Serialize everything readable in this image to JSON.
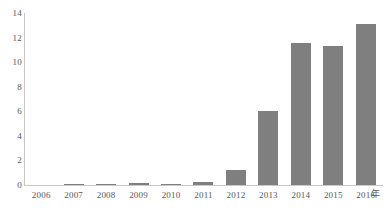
{
  "chart_data": {
    "type": "bar",
    "title": "",
    "subtitle": "",
    "xlabel": "年",
    "ylabel": "",
    "categories": [
      "2006",
      "2007",
      "2008",
      "2009",
      "2010",
      "2011",
      "2012",
      "2013",
      "2014",
      "2015",
      "2016"
    ],
    "values": [
      0,
      0.05,
      0.08,
      0.15,
      0.1,
      0.25,
      1.2,
      6.0,
      11.6,
      11.3,
      13.1
    ],
    "series": [
      {
        "name": "",
        "values": [
          0,
          0.05,
          0.08,
          0.15,
          0.1,
          0.25,
          1.2,
          6.0,
          11.6,
          11.3,
          13.1
        ]
      }
    ],
    "ylim": [
      0,
      14
    ],
    "yticks": [
      0,
      2,
      4,
      6,
      8,
      10,
      12,
      14
    ],
    "ytick_labels": [
      "0",
      "2",
      "4",
      "6",
      "8",
      "10",
      "12",
      "14"
    ],
    "xtick_labels": [
      "2006",
      "2007",
      "2008",
      "2009",
      "2010",
      "2011",
      "2012",
      "2013",
      "2014",
      "2015",
      "2016"
    ],
    "axis_unit_label": "年",
    "grid": false,
    "legend": null,
    "legend_position": "none",
    "annotations": [],
    "colors": {
      "bar": "#7f7f7f",
      "axis": "#c9c9c9",
      "tick_text": "#585858",
      "background": "#ffffff"
    }
  }
}
